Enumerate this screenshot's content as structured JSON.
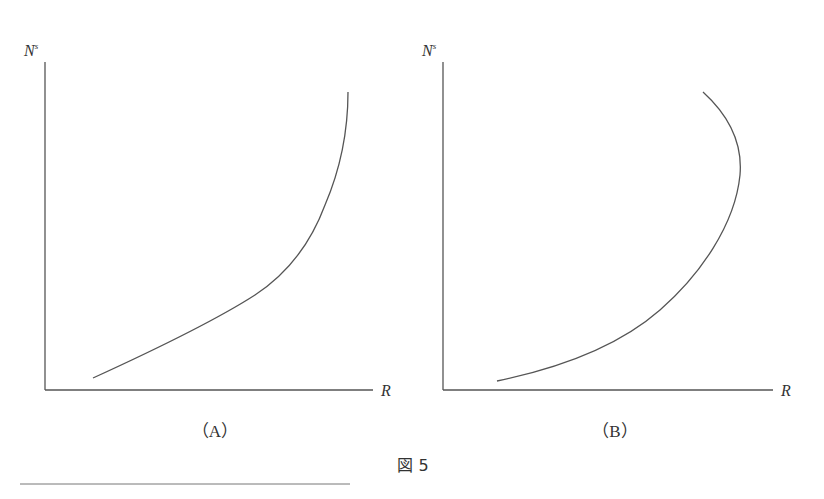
{
  "figure": {
    "caption": "図 5",
    "panels": [
      {
        "id": "A",
        "label": "（A）",
        "y_axis_label": "N",
        "y_axis_superscript": "s",
        "x_axis_label": "R",
        "curve_description": "monotonically increasing, convex, becoming vertical"
      },
      {
        "id": "B",
        "label": "（B）",
        "y_axis_label": "N",
        "y_axis_superscript": "s",
        "x_axis_label": "R",
        "curve_description": "increasing then backward-bending"
      }
    ]
  },
  "colors": {
    "line": "#555555",
    "text": "#333333",
    "background": "#ffffff"
  }
}
